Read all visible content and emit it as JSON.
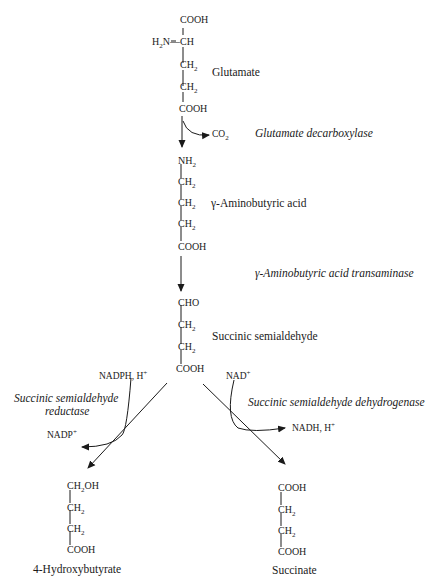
{
  "glutamate": {
    "name": "Glutamate",
    "atoms": [
      "COOH",
      "CH",
      "CH",
      "CH",
      "COOH"
    ],
    "amine": "H",
    "amine_sub": "2",
    "amine_rest": "N—",
    "sub2": "2"
  },
  "step1": {
    "enzyme": "Glutamate decarboxylase",
    "byproduct": "CO",
    "byproduct_sub": "2"
  },
  "gaba": {
    "name": "γ-Aminobutyric acid",
    "atoms": [
      "NH",
      "CH",
      "CH",
      "CH",
      "COOH"
    ],
    "sub2": "2"
  },
  "step2": {
    "enzyme": "γ-Aminobutyric acid transaminase"
  },
  "ssa": {
    "name": "Succinic semialdehyde",
    "atoms": [
      "CHO",
      "CH",
      "CH",
      "COOH"
    ],
    "sub2": "2"
  },
  "left_branch": {
    "enzyme_line1": "Succinic semialdehyde",
    "enzyme_line2": "reductase",
    "cofactor_in": "NADPH, H",
    "cofactor_in_sup": "+",
    "cofactor_out": "NADP",
    "cofactor_out_sup": "+"
  },
  "right_branch": {
    "enzyme": "Succinic semialdehyde dehydrogenase",
    "cofactor_in": "NAD",
    "cofactor_in_sup": "+",
    "cofactor_out": "NADH, H",
    "cofactor_out_sup": "+"
  },
  "hydroxybutyrate": {
    "name": "4-Hydroxybutyrate",
    "atoms": [
      "CH",
      "CH",
      "CH",
      "COOH"
    ],
    "oh": "OH",
    "sub2": "2"
  },
  "succinate": {
    "name": "Succinate",
    "atoms": [
      "COOH",
      "CH",
      "CH",
      "COOH"
    ],
    "sub2": "2"
  }
}
